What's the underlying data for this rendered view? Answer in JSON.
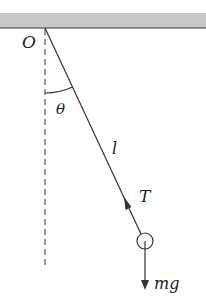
{
  "diagram": {
    "labels": {
      "pivot": "O",
      "angle": "θ",
      "length": "l",
      "tension": "T",
      "weight": "mg"
    },
    "colors": {
      "ceiling_fill": "#c8c8c8",
      "line": "#333333",
      "background": "#ffffff"
    }
  }
}
